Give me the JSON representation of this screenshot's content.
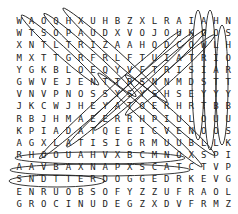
{
  "puzzle": {
    "type": "word-search",
    "rows": 16,
    "cols": 18,
    "grid": [
      [
        "W",
        "A",
        "O",
        "Q",
        "H",
        "X",
        "U",
        "H",
        "B",
        "Z",
        "X",
        "L",
        "R",
        "A",
        "I",
        "A",
        "H",
        "N"
      ],
      [
        "W",
        "T",
        "S",
        "O",
        "P",
        "A",
        "U",
        "D",
        "X",
        "V",
        "O",
        "J",
        "O",
        "U",
        "K",
        "O",
        "O",
        "S"
      ],
      [
        "X",
        "N",
        "T",
        "L",
        "T",
        "R",
        "I",
        "Z",
        "A",
        "A",
        "H",
        "Q",
        "D",
        "C",
        "O",
        "W",
        "L",
        "H"
      ],
      [
        "M",
        "X",
        "T",
        "T",
        "G",
        "R",
        "F",
        "R",
        "L",
        "F",
        "T",
        "U",
        "I",
        "A",
        "T",
        "R",
        "I",
        "O"
      ],
      [
        "Y",
        "G",
        "K",
        "B",
        "L",
        "O",
        "E",
        "Q",
        "Y",
        "V",
        "F",
        "T",
        "R",
        "I",
        "S",
        "I",
        "A",
        "R"
      ],
      [
        "G",
        "W",
        "V",
        "E",
        "J",
        "E",
        "N",
        "T",
        "T",
        "R",
        "S",
        "N",
        "N",
        "M",
        "D",
        "S",
        "T",
        "T"
      ],
      [
        "V",
        "N",
        "V",
        "P",
        "N",
        "O",
        "S",
        "S",
        "Y",
        "S",
        "Y",
        "S",
        "H",
        "S",
        "E",
        "Y",
        "Y",
        "Y"
      ],
      [
        "J",
        "K",
        "C",
        "W",
        "J",
        "H",
        "E",
        "Y",
        "A",
        "T",
        "O",
        "E",
        "R",
        "H",
        "R",
        "T",
        "B",
        "B"
      ],
      [
        "R",
        "B",
        "J",
        "H",
        "M",
        "A",
        "E",
        "E",
        "R",
        "R",
        "H",
        "P",
        "I",
        "U",
        "L",
        "O",
        "U",
        "U"
      ],
      [
        "K",
        "P",
        "I",
        "A",
        "D",
        "A",
        "T",
        "Q",
        "E",
        "E",
        "I",
        "C",
        "V",
        "E",
        "N",
        "O",
        "O",
        "S"
      ],
      [
        "A",
        "G",
        "X",
        "L",
        "A",
        "T",
        "I",
        "S",
        "I",
        "G",
        "R",
        "M",
        "U",
        "U",
        "B",
        "L",
        "L",
        "K"
      ],
      [
        "R",
        "H",
        "O",
        "O",
        "U",
        "A",
        "H",
        "V",
        "X",
        "B",
        "C",
        "M",
        "N",
        "O",
        "X",
        "S",
        "P",
        "I"
      ],
      [
        "A",
        "A",
        "V",
        "B",
        "A",
        "X",
        "N",
        "A",
        "P",
        "X",
        "S",
        "C",
        "A",
        "T",
        "C",
        "T",
        "V",
        "P"
      ],
      [
        "S",
        "N",
        "D",
        "T",
        "T",
        "E",
        "R",
        "D",
        "O",
        "G",
        "G",
        "E",
        "D",
        "R",
        "K",
        "E",
        "V",
        "G"
      ],
      [
        "E",
        "N",
        "R",
        "U",
        "O",
        "B",
        "S",
        "O",
        "F",
        "Y",
        "Z",
        "Z",
        "U",
        "F",
        "R",
        "A",
        "O",
        "L"
      ],
      [
        "G",
        "R",
        "O",
        "C",
        "I",
        "N",
        "U",
        "D",
        "E",
        "G",
        "Z",
        "X",
        "D",
        "V",
        "F",
        "R",
        "M",
        "Z"
      ],
      [
        "M",
        "Y",
        "X",
        "L",
        "H",
        "J",
        "I",
        "H",
        "W",
        "Q",
        "W",
        "V",
        "V",
        "E",
        "I",
        "P",
        "D",
        "I"
      ],
      [
        "Q",
        "Q",
        "K",
        "U",
        "T",
        "X",
        "C",
        "I",
        "Q",
        "F",
        "N",
        "K",
        "T",
        "C",
        "N",
        "P",
        "M",
        "D"
      ]
    ],
    "found_words": [
      "UNICORG",
      "ENRUOBSOF",
      "DETTERDOGGED",
      "WORLD",
      "HOOS",
      "SHORTY",
      "ISHORTY"
    ],
    "circle_color": "#222222"
  }
}
